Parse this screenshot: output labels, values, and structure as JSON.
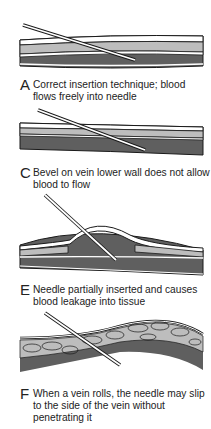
{
  "figure": {
    "colors": {
      "blood": "#5f5f5f",
      "tissue_light": "#bdbdbd",
      "outline": "#1a1a1a",
      "wall": "#ffffff"
    },
    "panels": [
      {
        "letter": "A",
        "caption": "Correct insertion technique; blood flows freely into needle"
      },
      {
        "letter": "C",
        "caption": "Bevel on vein lower wall does not allow blood to flow"
      },
      {
        "letter": "E",
        "caption": "Needle partially inserted and causes blood leakage into tissue"
      },
      {
        "letter": "F",
        "caption": "When a vein rolls, the needle may slip to the side of the vein without penetrating it"
      }
    ]
  }
}
